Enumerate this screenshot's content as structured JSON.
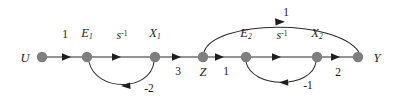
{
  "diagram": {
    "type": "signal-flow-graph",
    "title": "",
    "node_color": "#7f7f7f",
    "edge_color": "#707070",
    "arc_color": "#2b2b2b",
    "text_color": "#1b1b1b",
    "background": "#ffffff",
    "nodes": [
      {
        "id": "U",
        "label": "U",
        "sub": "",
        "x": 42,
        "y": 57,
        "label_x": 25,
        "label_y": 58
      },
      {
        "id": "E1",
        "label": "E",
        "sub": "1",
        "x": 87,
        "y": 57,
        "label_x": 87,
        "label_y": 34
      },
      {
        "id": "X1",
        "label": "X",
        "sub": "1",
        "x": 155,
        "y": 57,
        "label_x": 155,
        "label_y": 34
      },
      {
        "id": "Z",
        "label": "Z",
        "sub": "",
        "x": 203,
        "y": 57,
        "label_x": 203,
        "label_y": 72
      },
      {
        "id": "E2",
        "label": "E",
        "sub": "2",
        "x": 246,
        "y": 57,
        "label_x": 246,
        "label_y": 34
      },
      {
        "id": "X2",
        "label": "X",
        "sub": "2",
        "x": 317,
        "y": 57,
        "label_x": 317,
        "label_y": 34
      },
      {
        "id": "Y",
        "label": "Y",
        "sub": "",
        "x": 358,
        "y": 57,
        "label_x": 377,
        "label_y": 58
      }
    ],
    "edges": [
      {
        "from": "U",
        "to": "E1",
        "gain": "1",
        "kind": "straight",
        "label_x": 65,
        "label_y": 35
      },
      {
        "from": "E1",
        "to": "X1",
        "gain": "s",
        "sup": "-1",
        "kind": "straight",
        "label_x": 122,
        "label_y": 35
      },
      {
        "from": "X1",
        "to": "Z",
        "gain": "3",
        "kind": "straight",
        "label_x": 178,
        "label_y": 72
      },
      {
        "from": "Z",
        "to": "E2",
        "gain": "1",
        "kind": "straight",
        "label_x": 226,
        "label_y": 72
      },
      {
        "from": "E2",
        "to": "X2",
        "gain": "s",
        "sup": "-1",
        "kind": "straight",
        "label_x": 282,
        "label_y": 35
      },
      {
        "from": "X2",
        "to": "Y",
        "gain": "2",
        "kind": "straight",
        "label_x": 338,
        "label_y": 73
      },
      {
        "from": "X1",
        "to": "E1",
        "gain": "-2",
        "kind": "arc-below",
        "label_x": 149,
        "label_y": 89
      },
      {
        "from": "X2",
        "to": "E2",
        "gain": "-1",
        "kind": "arc-below",
        "label_x": 308,
        "label_y": 86
      },
      {
        "from": "Z",
        "to": "Y",
        "gain": "1",
        "kind": "arc-above",
        "label_x": 286,
        "label_y": 13
      }
    ]
  }
}
